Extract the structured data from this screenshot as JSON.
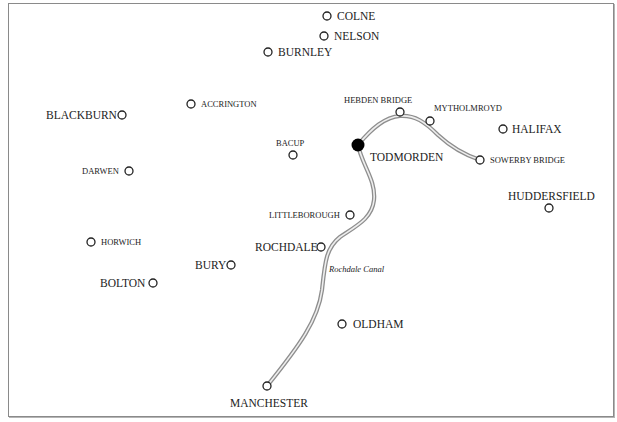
{
  "map": {
    "title": "",
    "canal": {
      "name": "Rochdale Canal",
      "color": "#9a9a9a",
      "route": [
        "MANCHESTER",
        "ROCHDALE",
        "TODMORDEN",
        "HEBDEN BRIDGE",
        "SOWERBY BRIDGE"
      ]
    },
    "highlight_town": "TODMORDEN",
    "towns": [
      {
        "name": "COLNE",
        "x": 327,
        "y": 16
      },
      {
        "name": "NELSON",
        "x": 324,
        "y": 36
      },
      {
        "name": "BURNLEY",
        "x": 268,
        "y": 52
      },
      {
        "name": "ACCRINGTON",
        "x": 191,
        "y": 104
      },
      {
        "name": "BLACKBURN",
        "x": 122,
        "y": 115
      },
      {
        "name": "HEBDEN BRIDGE",
        "x": 400,
        "y": 112
      },
      {
        "name": "MYTHOLMROYD",
        "x": 430,
        "y": 121
      },
      {
        "name": "HALIFAX",
        "x": 503,
        "y": 129
      },
      {
        "name": "BACUP",
        "x": 293,
        "y": 155
      },
      {
        "name": "TODMORDEN",
        "x": 358,
        "y": 145
      },
      {
        "name": "SOWERBY BRIDGE",
        "x": 480,
        "y": 160
      },
      {
        "name": "DARWEN",
        "x": 129,
        "y": 171
      },
      {
        "name": "HUDDERSFIELD",
        "x": 549,
        "y": 208
      },
      {
        "name": "LITTLEBOROUGH",
        "x": 350,
        "y": 215
      },
      {
        "name": "HORWICH",
        "x": 91,
        "y": 242
      },
      {
        "name": "ROCHDALE",
        "x": 321,
        "y": 247
      },
      {
        "name": "BURY",
        "x": 231,
        "y": 265
      },
      {
        "name": "BOLTON",
        "x": 153,
        "y": 283
      },
      {
        "name": "OLDHAM",
        "x": 342,
        "y": 324
      },
      {
        "name": "MANCHESTER",
        "x": 267,
        "y": 386
      }
    ],
    "labels": {
      "colne": "COLNE",
      "nelson": "NELSON",
      "burnley": "BURNLEY",
      "accrington": "ACCRINGTON",
      "blackburn": "BLACKBURN",
      "hebden_bridge": "HEBDEN BRIDGE",
      "mytholmroyd": "MYTHOLMROYD",
      "halifax": "HALIFAX",
      "bacup": "BACUP",
      "todmorden": "TODMORDEN",
      "sowerby_bridge": "SOWERBY BRIDGE",
      "darwen": "DARWEN",
      "huddersfield": "HUDDERSFIELD",
      "littleborough": "LITTLEBOROUGH",
      "horwich": "HORWICH",
      "rochdale": "ROCHDALE",
      "bury": "BURY",
      "bolton": "BOLTON",
      "oldham": "OLDHAM",
      "manchester": "MANCHESTER",
      "canal": "Rochdale Canal"
    }
  }
}
